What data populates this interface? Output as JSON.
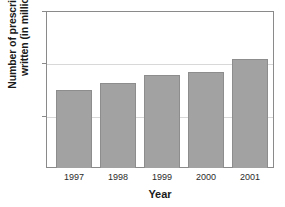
{
  "chart_data": {
    "type": "bar",
    "title": "",
    "subtitle": "",
    "xlabel": "Year",
    "ylabel": "Number of prescriptions written (in millions)",
    "ylabel_lines": [
      "Number of prescriptions",
      "written (in millions)"
    ],
    "categories": [
      "1997",
      "1998",
      "1999",
      "2000",
      "2001"
    ],
    "values": [
      15.0,
      16.2,
      17.8,
      18.4,
      20.8
    ],
    "yticks": [
      0,
      10,
      20,
      30
    ],
    "ytick_labels": [
      "0",
      "10",
      "20",
      "30"
    ],
    "ylim": [
      0,
      30
    ],
    "xlim": [
      0,
      5
    ],
    "grid": "horizontal",
    "legend": "none",
    "series": [
      {
        "name": "Prescriptions written",
        "values": [
          15.0,
          16.2,
          17.8,
          18.4,
          20.8
        ]
      }
    ],
    "annotations": [],
    "colors": {
      "bar_fill": "#a2a2a2",
      "bar_edge": "#8d8d8d",
      "gridline": "#d8d8d8",
      "axis": "#8a8a8a",
      "background": "#ffffff",
      "text": "#1a1a1a"
    }
  }
}
